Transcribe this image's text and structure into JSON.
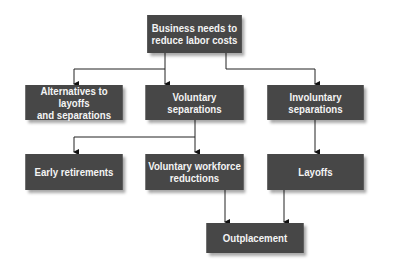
{
  "diagram": {
    "type": "flowchart",
    "nodes": {
      "root": "Business needs to\nreduce labor costs",
      "alternatives": "Alternatives to layoffs\nand separations",
      "voluntary": "Voluntary\nseparations",
      "involuntary": "Involuntary\nseparations",
      "early_retirements": "Early retirements",
      "voluntary_reductions": "Voluntary workforce\nreductions",
      "layoffs": "Layoffs",
      "outplacement": "Outplacement"
    },
    "edges": [
      [
        "root",
        "alternatives"
      ],
      [
        "root",
        "voluntary"
      ],
      [
        "root",
        "involuntary"
      ],
      [
        "voluntary",
        "early_retirements"
      ],
      [
        "voluntary",
        "voluntary_reductions"
      ],
      [
        "involuntary",
        "layoffs"
      ],
      [
        "voluntary_reductions",
        "outplacement"
      ],
      [
        "layoffs",
        "outplacement"
      ]
    ],
    "colors": {
      "box": "#474747",
      "text": "#f4f4f4",
      "line": "#222222"
    }
  }
}
